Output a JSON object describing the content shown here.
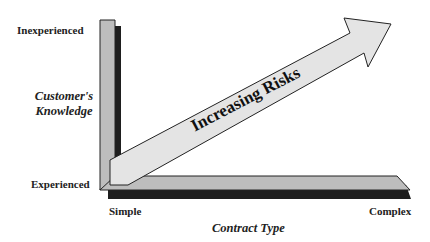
{
  "y_axis": {
    "top_label": "Inexperienced",
    "bottom_label": "Experienced",
    "title_line1": "Customer's",
    "title_line2": "Knowledge"
  },
  "x_axis": {
    "left_label": "Simple",
    "right_label": "Complex",
    "title": "Contract Type"
  },
  "arrow": {
    "label": "Increasing Risks"
  },
  "colors": {
    "bar_fill": "#bdbdbd",
    "shadow": "#1e1e1e",
    "arrow_fill": "#e4e4e4",
    "outline": "#222222"
  }
}
